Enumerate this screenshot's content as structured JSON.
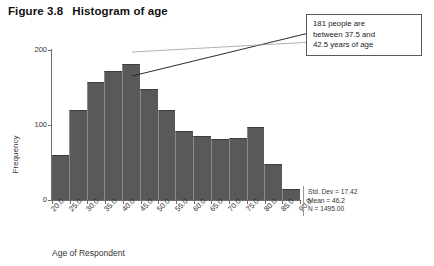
{
  "figure": {
    "number": "Figure 3.8",
    "caption": "Histogram of age"
  },
  "callout": {
    "line1": "181 people are",
    "line2": "between 37.5 and",
    "line3": "42.5 years of age"
  },
  "stats": {
    "std_dev": "Std. Dev = 17.42",
    "mean": "Mean = 46.2",
    "n": "N = 1495.00"
  },
  "chart_data": {
    "type": "bar",
    "title": "Histogram of age",
    "xlabel": "Age of Respondent",
    "ylabel": "Frequency",
    "ylim": [
      0,
      200
    ],
    "yticks": [
      0,
      100,
      200
    ],
    "ytick_labels": [
      "0",
      "100",
      "200"
    ],
    "xticks": [
      20.0,
      25.0,
      30.0,
      35.0,
      40.0,
      45.0,
      50.0,
      55.0,
      60.0,
      65.0,
      70.0,
      75.0,
      80.0,
      85.0,
      90.0
    ],
    "xtick_labels": [
      "20.0",
      "25.0",
      "30.0",
      "35.0",
      "40.0",
      "45.0",
      "50.0",
      "55.0",
      "60.0",
      "65.0",
      "70.0",
      "75.0",
      "80.0",
      "85.0",
      "90.0"
    ],
    "grid": false,
    "legend": false,
    "bin_width": 5,
    "bin_centers": [
      22.5,
      27.5,
      32.5,
      37.5,
      42.5,
      47.5,
      52.5,
      57.5,
      62.5,
      67.5,
      72.5,
      77.5,
      82.5,
      87.5
    ],
    "categories": [
      "20-25",
      "25-30",
      "30-35",
      "35-40",
      "40-45",
      "45-50",
      "50-55",
      "55-60",
      "60-65",
      "65-70",
      "70-75",
      "75-80",
      "80-85",
      "85-90"
    ],
    "values": [
      60,
      120,
      157,
      172,
      181,
      148,
      120,
      92,
      85,
      82,
      83,
      97,
      48,
      15
    ],
    "bar_color": "#595959",
    "annotations": [
      {
        "text": "181 people are between 37.5 and 42.5 years of age",
        "points_to_bin": "40-45",
        "value": 181
      }
    ]
  }
}
